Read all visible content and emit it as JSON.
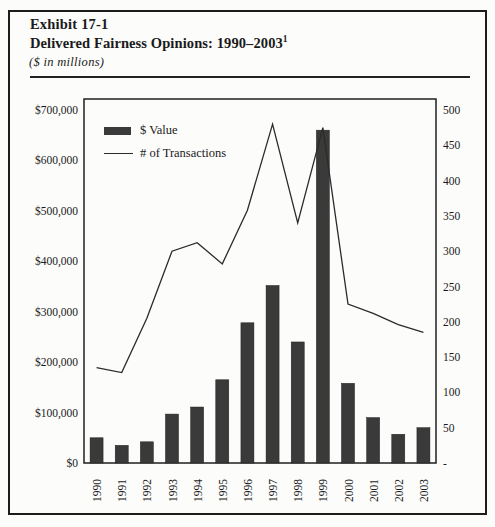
{
  "header": {
    "exhibit_label": "Exhibit 17-1",
    "title": "Delivered Fairness Opinions: 1990–2003",
    "footnote_marker": "1",
    "units_note": "($ in millions)"
  },
  "legend": {
    "value_label": "$ Value",
    "transactions_label": "# of Transactions"
  },
  "colors": {
    "bar_fill": "#3a3a3a",
    "line_stroke": "#2b2b2b",
    "axis_stroke": "#1f1f1f",
    "text": "#1a1a1a",
    "page_background": "#fcfcfa"
  },
  "chart_data": {
    "type": "bar",
    "subtype": "combo bar + line, dual y-axis",
    "title": "Delivered Fairness Opinions: 1990–2003",
    "units": "$ in millions",
    "grid": false,
    "legend_position": "top-left inside plot",
    "categories": [
      "1990",
      "1991",
      "1992",
      "1993",
      "1994",
      "1995",
      "1996",
      "1997",
      "1998",
      "1999",
      "2000",
      "2001",
      "2002",
      "2003"
    ],
    "series": [
      {
        "name": "$ Value",
        "type": "bar",
        "axis": "left",
        "values": [
          50000,
          35000,
          42000,
          97000,
          111000,
          165000,
          278000,
          352000,
          240000,
          660000,
          158000,
          90000,
          57000,
          70000
        ]
      },
      {
        "name": "# of Transactions",
        "type": "line",
        "axis": "right",
        "values": [
          135,
          128,
          205,
          300,
          312,
          282,
          358,
          480,
          340,
          475,
          225,
          212,
          196,
          185
        ]
      }
    ],
    "left_axis": {
      "min": 0,
      "max": 700000,
      "step": 100000,
      "tick_labels": [
        "$0",
        "$100,000",
        "$200,000",
        "$300,000",
        "$400,000",
        "$500,000",
        "$600,000",
        "$700,000"
      ]
    },
    "right_axis": {
      "min": 0,
      "max": 500,
      "step": 50,
      "tick_labels": [
        "-",
        "50",
        "100",
        "150",
        "200",
        "250",
        "300",
        "350",
        "400",
        "450",
        "500"
      ]
    }
  }
}
